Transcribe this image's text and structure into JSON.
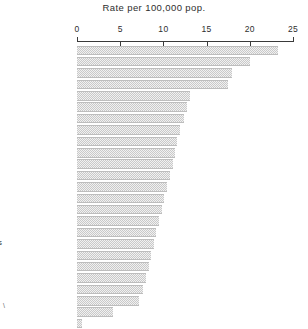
{
  "chart_data": {
    "type": "bar",
    "orientation": "horizontal",
    "title": "Rate per 100,000 pop.",
    "xlabel": "",
    "ylabel": "",
    "xlim": [
      0,
      25
    ],
    "xticks": [
      0,
      5,
      10,
      15,
      20,
      25
    ],
    "xtick_labels": [
      "0",
      "5",
      "10",
      "15",
      "20",
      "25"
    ],
    "grid": false,
    "legend": "none",
    "bar_color": "#c9c9c9",
    "categories": [
      "U.S., Nonwhite",
      "Chile",
      "Austria",
      "Denmark",
      "Japan",
      "Italy",
      "Germany, F.R.",
      "South Africa",
      "Switzerland",
      "Portugal",
      "Belgium",
      "France",
      "Canada",
      "Scotland",
      "Finland",
      "New Zealand",
      "U.S., White",
      "England & Wales",
      "Netherlands",
      "Sweden",
      "Norway",
      "Australia",
      "North Ireland",
      "Ireland",
      "Israel"
    ],
    "values": [
      23.3,
      20.0,
      17.9,
      17.5,
      13.1,
      12.7,
      12.4,
      11.9,
      11.6,
      11.4,
      11.1,
      10.8,
      10.4,
      10.1,
      9.8,
      9.5,
      9.2,
      8.9,
      8.6,
      8.3,
      8.0,
      7.6,
      7.2,
      4.2,
      0.6
    ]
  },
  "bottom_mark": "\\"
}
